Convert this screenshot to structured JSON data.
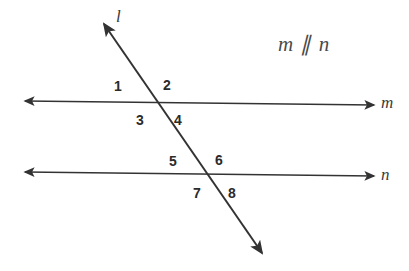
{
  "figure": {
    "type": "geometry-diagram",
    "background_color": "#ffffff",
    "stroke_color": "#333333",
    "text_color": "#2b2b2b",
    "relation": {
      "text": "m ∥ n",
      "x": 278,
      "y": 34
    },
    "lines": [
      {
        "name": "transversal-line-l",
        "label": "l",
        "label_x": 116,
        "label_y": 8,
        "x1": 104,
        "y1": 24,
        "x2": 262,
        "y2": 253,
        "arrow_start": true,
        "arrow_end": true
      },
      {
        "name": "parallel-line-m",
        "label": "m",
        "label_x": 381,
        "label_y": 94,
        "x1": 25,
        "y1": 101,
        "x2": 374,
        "y2": 105,
        "arrow_start": true,
        "arrow_end": true
      },
      {
        "name": "parallel-line-n",
        "label": "n",
        "label_x": 381,
        "label_y": 166,
        "x1": 25,
        "y1": 172,
        "x2": 374,
        "y2": 176,
        "arrow_start": true,
        "arrow_end": true
      }
    ],
    "intersections": [
      {
        "name": "intersection-l-m",
        "x": 158,
        "y": 104
      },
      {
        "name": "intersection-l-n",
        "x": 205,
        "y": 176
      }
    ],
    "angle_labels": [
      {
        "id": "angle-1",
        "text": "1",
        "x": 114,
        "y": 79
      },
      {
        "id": "angle-2",
        "text": "2",
        "x": 163,
        "y": 78
      },
      {
        "id": "angle-3",
        "text": "3",
        "x": 136,
        "y": 113
      },
      {
        "id": "angle-4",
        "text": "4",
        "x": 174,
        "y": 113
      },
      {
        "id": "angle-5",
        "text": "5",
        "x": 169,
        "y": 154
      },
      {
        "id": "angle-6",
        "text": "6",
        "x": 215,
        "y": 153
      },
      {
        "id": "angle-7",
        "text": "7",
        "x": 193,
        "y": 186
      },
      {
        "id": "angle-8",
        "text": "8",
        "x": 228,
        "y": 186
      }
    ]
  }
}
